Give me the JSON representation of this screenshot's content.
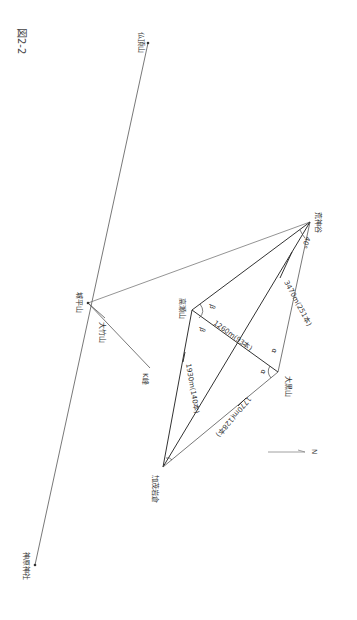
{
  "figure": {
    "title": "図2-2",
    "orientation": "rotated 90° clockwise"
  },
  "points": {
    "kojindani": {
      "label": "荒神谷",
      "x": 310,
      "y": 222
    },
    "jodairayama": {
      "label": "城平山",
      "x": 88,
      "y": 303
    },
    "takaseyama": {
      "label": "高瀬山",
      "x": 192,
      "y": 310
    },
    "daikokuyama": {
      "label": "大黒山",
      "x": 278,
      "y": 372
    },
    "kamoiwakura": {
      "label": "加茂岩倉",
      "x": 163,
      "y": 467
    },
    "butchozan": {
      "label": "仏頂山",
      "x": 148,
      "y": 43
    },
    "kanbarajinja": {
      "label": "神原神社",
      "x": 35,
      "y": 565
    },
    "otakeyama": {
      "label": "大竹山",
      "x": 105,
      "y": 318
    },
    "k_peak": {
      "label": "K峰",
      "x": 150,
      "y": 368
    }
  },
  "measurements": {
    "kojindani_daikokuyama": "3470m(251本)",
    "takaseyama_daikokuyama": "1260m(93本)",
    "takaseyama_kamoiwakura": "1930m(140本)",
    "daikokuyama_kamoiwakura": "1770m(128本)"
  },
  "angles": {
    "kojindani": "40°",
    "alpha": "α",
    "beta": "β"
  },
  "north": {
    "label": "N"
  }
}
